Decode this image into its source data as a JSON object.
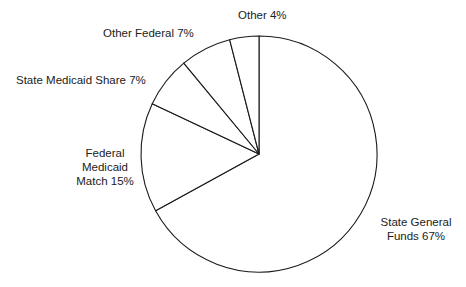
{
  "chart_data": {
    "type": "pie",
    "title": "",
    "start_angle_deg": 90,
    "direction": "clockwise",
    "slices": [
      {
        "label": "State General Funds",
        "value": 67,
        "display": "State General Funds 67%"
      },
      {
        "label": "Federal Medicaid Match",
        "value": 15,
        "display": "Federal Medicaid Match 15%"
      },
      {
        "label": "State Medicaid Share",
        "value": 7,
        "display": "State Medicaid Share 7%"
      },
      {
        "label": "Other Federal",
        "value": 7,
        "display": "Other Federal 7%"
      },
      {
        "label": "Other",
        "value": 4,
        "display": "Other 4%"
      }
    ],
    "legend": "none (labels placed outside slices)",
    "colors": {
      "fill": "#ffffff",
      "stroke": "#1a1a1a"
    }
  },
  "labels": {
    "state_general_line1": "State General",
    "state_general_line2": "Funds 67%",
    "federal_match_line1": "Federal",
    "federal_match_line2": "Medicaid",
    "federal_match_line3": "Match 15%",
    "state_medicaid": "State Medicaid Share 7%",
    "other_federal": "Other Federal 7%",
    "other": "Other 4%"
  }
}
